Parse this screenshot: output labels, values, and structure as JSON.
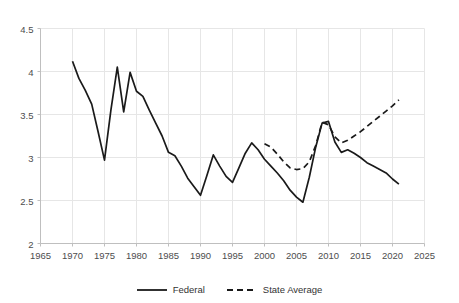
{
  "chart_data": {
    "type": "line",
    "title": "",
    "xlabel": "",
    "ylabel": "",
    "xlim": [
      1965,
      2025
    ],
    "ylim": [
      2,
      4.5
    ],
    "grid": true,
    "legend_position": "bottom",
    "x_ticks": [
      1965,
      1970,
      1975,
      1980,
      1985,
      1990,
      1995,
      2000,
      2005,
      2010,
      2015,
      2020,
      2025
    ],
    "y_ticks": [
      "2",
      "2.5",
      "3",
      "3.5",
      "4",
      "4.5"
    ],
    "y_tick_values": [
      2,
      2.5,
      3,
      3.5,
      4,
      4.5
    ],
    "series": [
      {
        "name": "Federal",
        "style": "solid",
        "color": "#1a1a1a",
        "x": [
          1970,
          1971,
          1972,
          1973,
          1974,
          1975,
          1976,
          1977,
          1978,
          1979,
          1980,
          1981,
          1982,
          1983,
          1984,
          1985,
          1986,
          1987,
          1988,
          1989,
          1990,
          1991,
          1992,
          1993,
          1994,
          1995,
          1996,
          1997,
          1998,
          1999,
          2000,
          2001,
          2002,
          2003,
          2004,
          2005,
          2006,
          2007,
          2008,
          2009,
          2010,
          2011,
          2012,
          2013,
          2014,
          2015,
          2016,
          2017,
          2018,
          2019,
          2020,
          2021
        ],
        "values": [
          4.12,
          3.92,
          3.78,
          3.62,
          3.3,
          2.97,
          3.55,
          4.05,
          3.53,
          3.99,
          3.77,
          3.71,
          3.55,
          3.4,
          3.25,
          3.06,
          3.02,
          2.9,
          2.76,
          2.66,
          2.56,
          2.79,
          3.03,
          2.9,
          2.78,
          2.71,
          2.88,
          3.05,
          3.17,
          3.09,
          2.98,
          2.9,
          2.82,
          2.73,
          2.62,
          2.54,
          2.48,
          2.77,
          3.12,
          3.4,
          3.42,
          3.18,
          3.06,
          3.09,
          3.05,
          3.0,
          2.94,
          2.9,
          2.86,
          2.82,
          2.75,
          2.69
        ]
      },
      {
        "name": "State Average",
        "style": "dashed",
        "color": "#1a1a1a",
        "x": [
          2000,
          2001,
          2002,
          2003,
          2004,
          2005,
          2006,
          2007,
          2008,
          2009,
          2010,
          2011,
          2012,
          2013,
          2014,
          2015,
          2016,
          2017,
          2018,
          2019,
          2020,
          2021
        ],
        "values": [
          3.16,
          3.12,
          3.04,
          2.95,
          2.88,
          2.86,
          2.87,
          2.95,
          3.14,
          3.41,
          3.38,
          3.24,
          3.17,
          3.2,
          3.25,
          3.3,
          3.36,
          3.42,
          3.48,
          3.54,
          3.6,
          3.67
        ]
      }
    ]
  },
  "legend": {
    "entries": [
      {
        "label": "Federal",
        "icon": "solid-line-icon"
      },
      {
        "label": "State Average",
        "icon": "dashed-line-icon"
      }
    ]
  },
  "colors": {
    "series": "#1a1a1a",
    "grid": "#e6e6e6",
    "axis": "#bfbfbf",
    "tick_text": "#4d4d4d"
  }
}
